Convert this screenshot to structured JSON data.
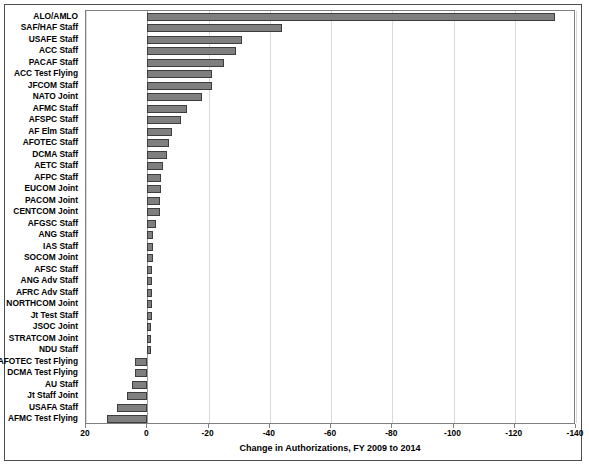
{
  "chart_data": {
    "type": "bar",
    "orientation": "horizontal",
    "title": "",
    "xlabel": "Change in Authorizations, FY 2009 to 2014",
    "ylabel": "",
    "xlim": [
      20,
      -140
    ],
    "xticks": [
      20,
      0,
      -20,
      -40,
      -60,
      -80,
      -100,
      -120,
      -140
    ],
    "xtick_labels": [
      "20",
      "0",
      "-20",
      "-40",
      "-60",
      "-80",
      "-100",
      "-120",
      "-140"
    ],
    "grid": "vertical",
    "legend": "none",
    "bar_color": "#7f7f7f",
    "bar_edge_color": "#3d3d3d",
    "categories": [
      "ALO/AMLO",
      "SAF/HAF Staff",
      "USAFE Staff",
      "ACC Staff",
      "PACAF Staff",
      "ACC Test Flying",
      "JFCOM Staff",
      "NATO Joint",
      "AFMC Staff",
      "AFSPC Staff",
      "AF Elm Staff",
      "AFOTEC Staff",
      "DCMA Staff",
      "AETC Staff",
      "AFPC Staff",
      "EUCOM Joint",
      "PACOM Joint",
      "CENTCOM Joint",
      "AFGSC Staff",
      "ANG Staff",
      "IAS Staff",
      "SOCOM Joint",
      "AFSC Staff",
      "ANG Adv Staff",
      "AFRC Adv Staff",
      "NORTHCOM Joint",
      "Jt Test Staff",
      "JSOC Joint",
      "STRATCOM Joint",
      "NDU Staff",
      "AFOTEC Test Flying",
      "DCMA Test Flying",
      "AU Staff",
      "Jt Staff Joint",
      "USAFA Staff",
      "AFMC Test Flying"
    ],
    "values": [
      -133,
      -44,
      -31,
      -29,
      -25,
      -21,
      -21,
      -18,
      -13,
      -11,
      -8,
      -7,
      -6.5,
      -5,
      -4.6,
      -4.5,
      -4,
      -4,
      -3,
      -2,
      -2,
      -2,
      -1.6,
      -1.6,
      -1.6,
      -1.6,
      -1.6,
      -1.2,
      -1.2,
      -1.2,
      4,
      4,
      5,
      6.5,
      10,
      13
    ]
  }
}
